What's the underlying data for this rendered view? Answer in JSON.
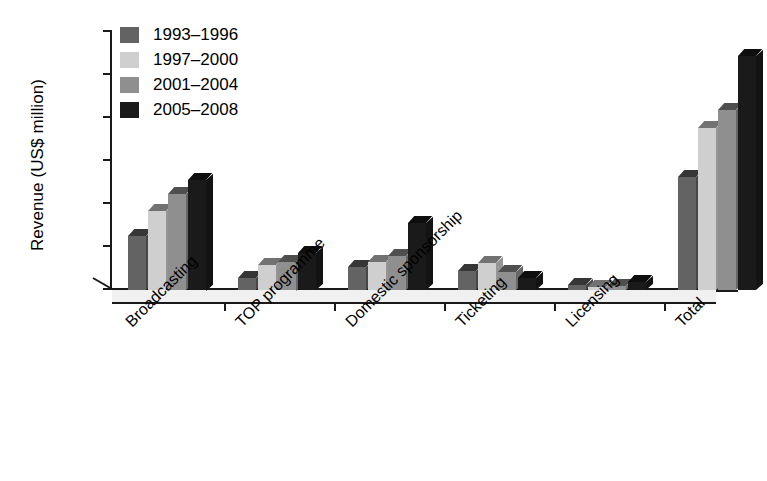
{
  "chart_data": {
    "type": "bar",
    "title": "",
    "xlabel": "",
    "ylabel": "Revenue (US$ million)",
    "ylim": [
      0,
      6000
    ],
    "yticks": [
      0,
      1000,
      2000,
      3000,
      4000,
      5000,
      6000
    ],
    "ytick_labels": [
      "0",
      "1000",
      "2000",
      "3000",
      "4000",
      "5000",
      "6000"
    ],
    "grid": false,
    "legend_position": "top-left",
    "style": "3d-bars",
    "categories": [
      "Broadcasting",
      "TOP programme",
      "Domestic sponsorship",
      "Ticketing",
      "Licensing",
      "Total"
    ],
    "series": [
      {
        "name": "1993–1996",
        "color": "#636363",
        "values": [
          1251,
          279,
          534,
          451,
          115,
          2630
        ]
      },
      {
        "name": "1997–2000",
        "color": "#cfcfcf",
        "values": [
          1845,
          579,
          655,
          625,
          66,
          3770
        ]
      },
      {
        "name": "2001–2004",
        "color": "#8f8f8f",
        "values": [
          2232,
          663,
          796,
          411,
          87,
          4189
        ]
      },
      {
        "name": "2005–2008",
        "color": "#1a1a1a",
        "values": [
          2570,
          866,
          1555,
          274,
          185,
          5450
        ]
      }
    ]
  }
}
